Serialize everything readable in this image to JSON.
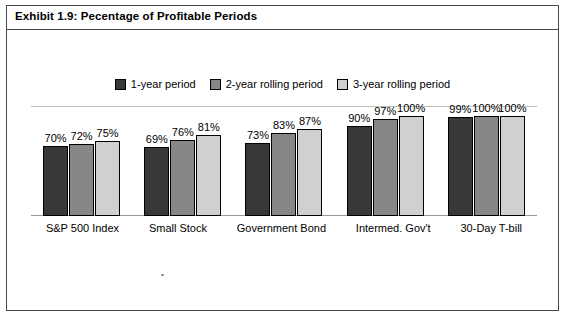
{
  "title": "Exhibit 1.9: Pecentage of Profitable Periods",
  "legend": [
    {
      "label": "1-year period",
      "color": "#383838"
    },
    {
      "label": "2-year rolling period",
      "color": "#878787"
    },
    {
      "label": "3-year rolling period",
      "color": "#d0d0d0"
    }
  ],
  "chart_data": {
    "type": "bar",
    "title": "Exhibit 1.9: Pecentage of Profitable Periods",
    "xlabel": "",
    "ylabel": "",
    "ylim": [
      0,
      110
    ],
    "grid": true,
    "legend_position": "top",
    "categories": [
      "S&P 500 Index",
      "Small Stock",
      "Government Bond",
      "Intermed. Gov't",
      "30-Day T-bill"
    ],
    "series": [
      {
        "name": "1-year period",
        "color": "#383838",
        "values": [
          70,
          69,
          73,
          90,
          99
        ],
        "labels": [
          "70%",
          "69%",
          "73%",
          "90%",
          "99%"
        ]
      },
      {
        "name": "2-year rolling period",
        "color": "#878787",
        "values": [
          72,
          76,
          83,
          97,
          100
        ],
        "labels": [
          "72%",
          "76%",
          "83%",
          "97%",
          "100%"
        ]
      },
      {
        "name": "3-year rolling period",
        "color": "#d0d0d0",
        "values": [
          75,
          81,
          87,
          100,
          100
        ],
        "labels": [
          "75%",
          "81%",
          "87%",
          "100%",
          "100%"
        ]
      }
    ]
  }
}
